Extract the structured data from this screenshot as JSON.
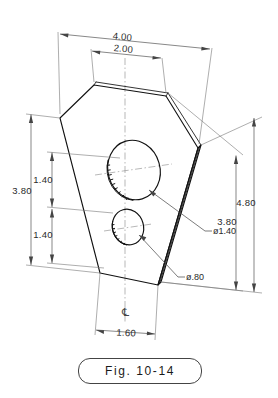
{
  "figure": {
    "label": "Fig. 10-14",
    "type": "isometric-technical-drawing",
    "line_color": "#111111",
    "dimension_color": "#555555"
  },
  "dimensions": {
    "top_overall": "4.00",
    "top_inner": "2.00",
    "left_overall": "3.80",
    "left_upper": "1.40",
    "left_lower": "1.40",
    "right_inner": "3.80",
    "right_overall": "4.80",
    "bottom": "1.60"
  },
  "hole_callouts": {
    "large": "ø1.40",
    "small": "ø.80"
  },
  "centerline": {
    "symbol": "℄"
  }
}
